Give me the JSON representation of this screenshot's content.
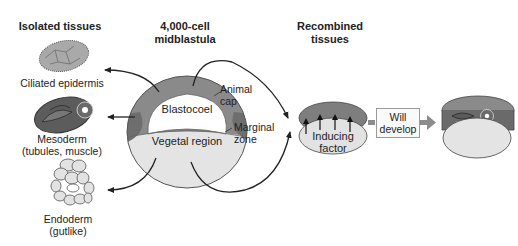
{
  "headers": {
    "isolated": "Isolated tissues",
    "midblastula_line1": "4,000-cell",
    "midblastula_line2": "midblastula",
    "recombined_line1": "Recombined",
    "recombined_line2": "tissues"
  },
  "isolated_tissues": [
    {
      "label_line1": "Ciliated epidermis",
      "label_line2": ""
    },
    {
      "label_line1": "Mesoderm",
      "label_line2": "(tubules, muscle)"
    },
    {
      "label_line1": "Endoderm",
      "label_line2": "(gutlike)"
    }
  ],
  "embryo": {
    "blastocoel": "Blastocoel",
    "vegetal": "Vegetal region",
    "animal_cap_line1": "Animal",
    "animal_cap_line2": "cap",
    "marginal_line1": "Marginal",
    "marginal_line2": "zone"
  },
  "recombined": {
    "inducing_line1": "Inducing",
    "inducing_line2": "factor"
  },
  "result_box": {
    "line1": "Will",
    "line2": "develop"
  },
  "colors": {
    "animal_cap": "#8a8a8a",
    "marginal": "#6e6e6e",
    "vegetal": "#e4e4e4",
    "arrow": "#222222",
    "box_arrow": "#8c8c8c"
  }
}
